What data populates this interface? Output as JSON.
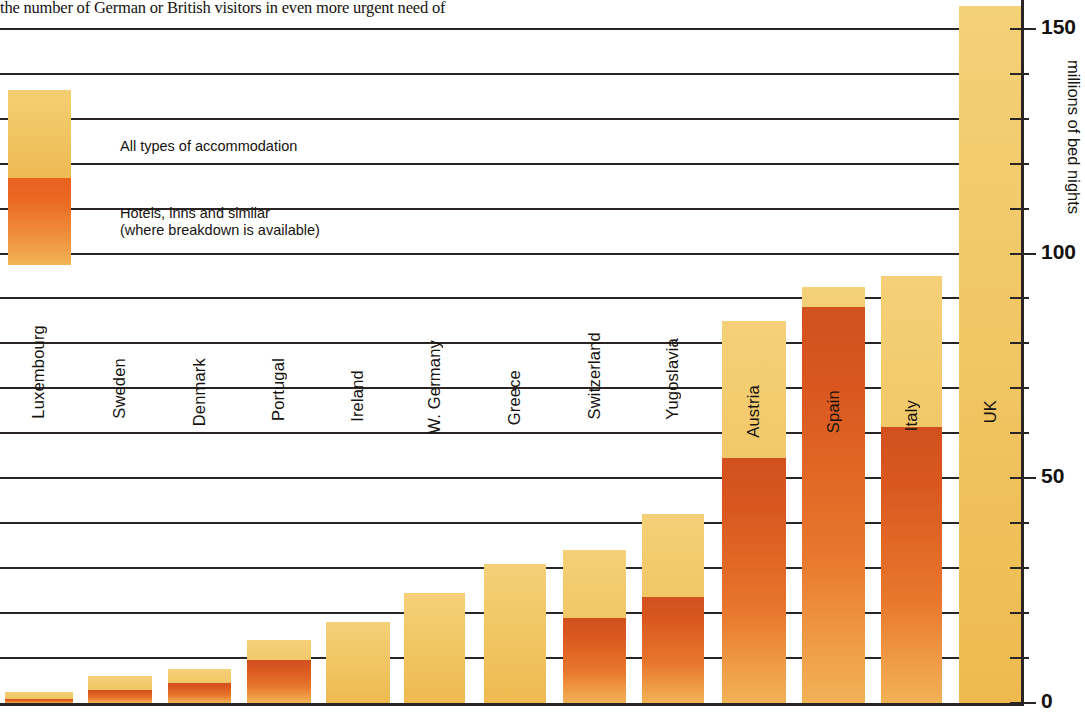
{
  "caption": {
    "text": "the number of German or British visitors in even more urgent need of"
  },
  "legend": {
    "all_label": "All types of accommodation",
    "hotels_label": "Hotels, inns and similar\n(where breakdown is available)",
    "all_color": "#F1C765",
    "hotels_color": "#D9571F"
  },
  "chart_data": {
    "type": "bar",
    "title": "",
    "xlabel": "",
    "ylabel": "millions of bed nights",
    "ylim": [
      0,
      160
    ],
    "ytick_labels": [
      "0",
      "50",
      "100",
      "150"
    ],
    "ytick_values": [
      0,
      50,
      100,
      150
    ],
    "minor_tick_step": 10,
    "grid": true,
    "legend_position": "top-left",
    "categories": [
      "Luxembourg",
      "Sweden",
      "Denmark",
      "Portugal",
      "Ireland",
      "W. Germany",
      "Greece",
      "Switzerland",
      "Yugoslavia",
      "Austria",
      "Spain",
      "Italy",
      "UK"
    ],
    "series": [
      {
        "name": "All types of accommodation",
        "values": [
          2.5,
          6,
          7.5,
          14,
          18,
          24.5,
          31,
          34,
          42,
          85,
          92.5,
          95,
          155
        ]
      },
      {
        "name": "Hotels, inns and similar",
        "values": [
          1,
          3,
          4.5,
          9.5,
          null,
          null,
          null,
          19,
          23.5,
          54.5,
          88,
          61.5,
          null
        ]
      }
    ]
  },
  "bars": [
    {
      "name": "Luxembourg",
      "label": "Luxembourg",
      "x": 5,
      "w": 68,
      "total": 2.5,
      "hotel": 1,
      "label_top": 325
    },
    {
      "name": "Sweden",
      "label": "Sweden",
      "x": 88,
      "w": 64,
      "total": 6,
      "hotel": 3,
      "label_top": 358
    },
    {
      "name": "Denmark",
      "label": "Denmark",
      "x": 168,
      "w": 63,
      "total": 7.5,
      "hotel": 4.5,
      "label_top": 358
    },
    {
      "name": "Portugal",
      "label": "Portugal",
      "x": 247,
      "w": 64,
      "total": 14,
      "hotel": 9.5,
      "label_top": 358
    },
    {
      "name": "Ireland",
      "label": "Ireland",
      "x": 326,
      "w": 64,
      "total": 18,
      "hotel": null,
      "label_top": 370
    },
    {
      "name": "W. Germany",
      "label": "W. Germany",
      "x": 404,
      "w": 61,
      "total": 24.5,
      "hotel": null,
      "label_top": 340
    },
    {
      "name": "Greece",
      "label": "Greece",
      "x": 484,
      "w": 62,
      "total": 31,
      "hotel": null,
      "label_top": 370
    },
    {
      "name": "Switzerland",
      "label": "Switzerland",
      "x": 563,
      "w": 63,
      "total": 34,
      "hotel": 19,
      "label_top": 332
    },
    {
      "name": "Yugoslavia",
      "label": "Yugoslavia",
      "x": 642,
      "w": 62,
      "total": 42,
      "hotel": 23.5,
      "label_top": 338
    },
    {
      "name": "Austria",
      "label": "Austria",
      "x": 722,
      "w": 64,
      "total": 85,
      "hotel": 54.5,
      "label_top": 385
    },
    {
      "name": "Spain",
      "label": "Spain",
      "x": 802,
      "w": 63,
      "total": 92.5,
      "hotel": 88,
      "label_top": 390
    },
    {
      "name": "Italy",
      "label": "Italy",
      "x": 881,
      "w": 61,
      "total": 95,
      "hotel": 61.5,
      "label_top": 400
    },
    {
      "name": "UK",
      "label": "UK",
      "x": 959,
      "w": 63,
      "total": 155,
      "hotel": null,
      "label_top": 400
    }
  ]
}
